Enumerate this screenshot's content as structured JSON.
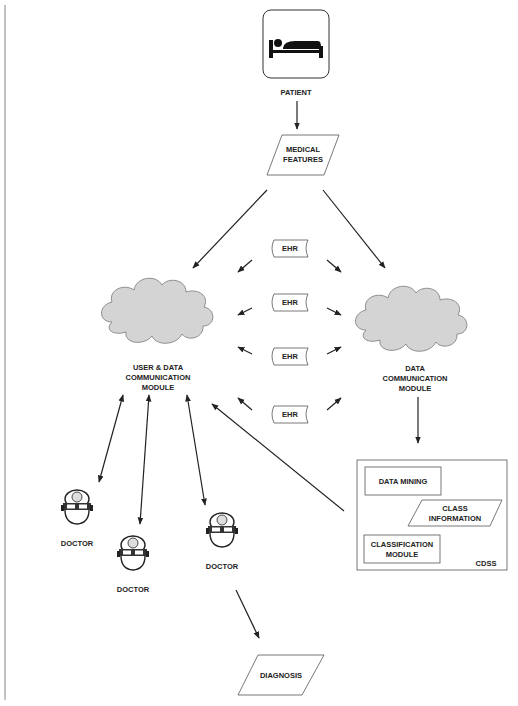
{
  "diagram": {
    "patient": {
      "label": "PATIENT",
      "icon": "bed-icon"
    },
    "medical_features": {
      "label1": "MEDICAL",
      "label2": "FEATURES"
    },
    "ehr": [
      "EHR",
      "EHR",
      "EHR",
      "EHR"
    ],
    "user_module": {
      "line1": "USER & DATA",
      "line2": "COMMUNICATION",
      "line3": "MODULE"
    },
    "data_module": {
      "line1": "DATA",
      "line2": "COMMUNICATION",
      "line3": "MODULE"
    },
    "cdss": {
      "label": "CDSS",
      "data_mining": "DATA MINING",
      "class_info": {
        "line1": "CLASS",
        "line2": "INFORMATION"
      },
      "classification": {
        "line1": "CLASSIFICATION",
        "line2": "MODULE"
      }
    },
    "doctors": [
      "DOCTOR",
      "DOCTOR",
      "DOCTOR"
    ],
    "diagnosis": "DIAGNOSIS",
    "colors": {
      "cloud_fill": "#d4d4d4",
      "stroke": "#222222",
      "left_rule": "#999999"
    }
  }
}
